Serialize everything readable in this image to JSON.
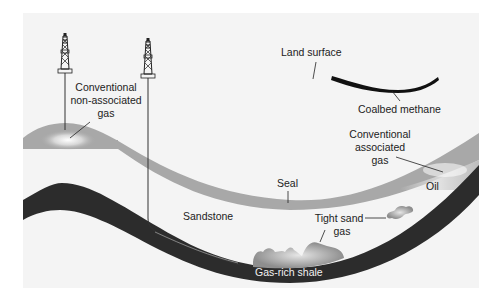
{
  "diagram": {
    "type": "geologic cross-section of natural gas resources",
    "labels": {
      "land_surface": "Land surface",
      "coalbed_methane": "Coalbed methane",
      "conventional_non_associated_gas": [
        "Conventional",
        "non-associated",
        "gas"
      ],
      "conventional_associated_gas": [
        "Conventional",
        "associated",
        "gas"
      ],
      "oil": "Oil",
      "seal": "Seal",
      "sandstone": "Sandstone",
      "tight_sand_gas": [
        "Tight sand",
        "gas"
      ],
      "gas_rich_shale": "Gas-rich shale"
    },
    "elements": [
      {
        "name": "vertical-well-derrick",
        "target": "conventional non-associated gas"
      },
      {
        "name": "horizontal-well-derrick",
        "target": "gas-rich shale"
      }
    ],
    "colors": {
      "background_panel": "#f4f4f4",
      "seal_layer": "#a8a8a8",
      "shale_layer": "#2c2c2c",
      "coalbed": "#111111",
      "tight_gas": "#8e8e8e",
      "text": "#222222"
    }
  }
}
